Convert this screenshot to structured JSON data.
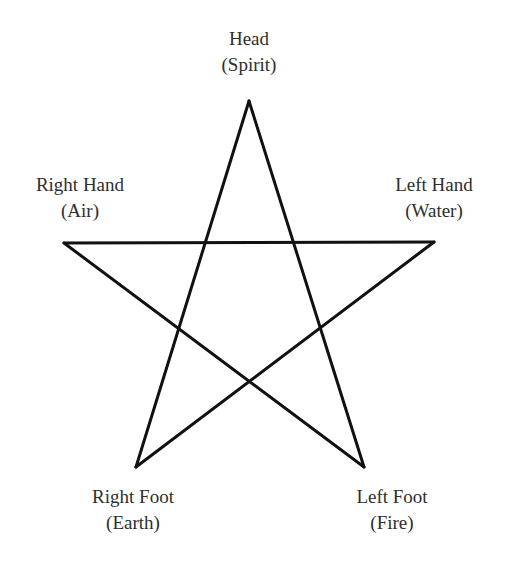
{
  "diagram": {
    "type": "pentagram",
    "stroke_color": "#111111",
    "text_color": "#2e2e2e",
    "background": "#ffffff",
    "vertices": {
      "head": {
        "x": 249,
        "y": 101
      },
      "right_hand": {
        "x": 64,
        "y": 243
      },
      "left_hand": {
        "x": 434,
        "y": 242
      },
      "right_foot": {
        "x": 136,
        "y": 467
      },
      "left_foot": {
        "x": 364,
        "y": 467
      }
    },
    "labels": {
      "head": {
        "name": "Head",
        "element": "(Spirit)"
      },
      "right_hand": {
        "name": "Right Hand",
        "element": "(Air)"
      },
      "left_hand": {
        "name": "Left Hand",
        "element": "(Water)"
      },
      "right_foot": {
        "name": "Right Foot",
        "element": "(Earth)"
      },
      "left_foot": {
        "name": "Left Foot",
        "element": "(Fire)"
      }
    }
  }
}
